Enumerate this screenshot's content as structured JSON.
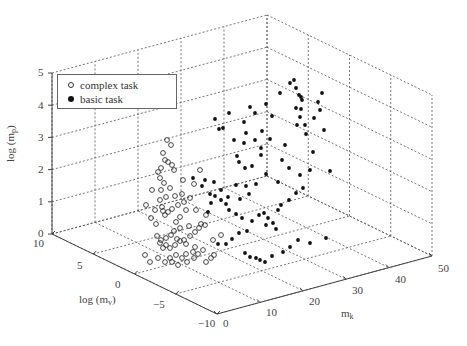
{
  "chart_data": {
    "type": "scatter",
    "subtype": "3d",
    "title": "",
    "axes": {
      "x": {
        "label": "m_k",
        "ticks": [
          "0",
          "10",
          "20",
          "30",
          "40",
          "50"
        ],
        "range": [
          0,
          50
        ]
      },
      "y": {
        "label": "log (m_v)",
        "ticks": [
          "10",
          "5",
          "0",
          "-5",
          "-10"
        ],
        "range": [
          -10,
          10
        ]
      },
      "z": {
        "label": "log (m_p)",
        "ticks": [
          "0",
          "1",
          "2",
          "3",
          "4",
          "5"
        ],
        "range": [
          0,
          5
        ]
      }
    },
    "grid": true,
    "legend": {
      "position": "upper-left",
      "entries": [
        {
          "label": "complex task",
          "marker": "open-circle"
        },
        {
          "label": "basic task",
          "marker": "filled-circle"
        }
      ]
    },
    "series": [
      {
        "name": "complex task",
        "marker": "open-circle",
        "description": "Clustered at low m_k (~0-10), log(m_v) roughly -5 to 10, log(m_p) ~0 to 2.5",
        "screen_points": [
          [
            163,
            153
          ],
          [
            165,
            160
          ],
          [
            168,
            162
          ],
          [
            172,
            165
          ],
          [
            174,
            170
          ],
          [
            160,
            178
          ],
          [
            164,
            183
          ],
          [
            161,
            190
          ],
          [
            170,
            188
          ],
          [
            166,
            197
          ],
          [
            175,
            196
          ],
          [
            182,
            194
          ],
          [
            160,
            200
          ],
          [
            162,
            207
          ],
          [
            163,
            211
          ],
          [
            165,
            215
          ],
          [
            168,
            212
          ],
          [
            172,
            209
          ],
          [
            178,
            205
          ],
          [
            184,
            202
          ],
          [
            190,
            198
          ],
          [
            186,
            210
          ],
          [
            176,
            222
          ],
          [
            180,
            228
          ],
          [
            174,
            231
          ],
          [
            171,
            235
          ],
          [
            166,
            238
          ],
          [
            161,
            240
          ],
          [
            157,
            236
          ],
          [
            160,
            243
          ],
          [
            163,
            248
          ],
          [
            166,
            245
          ],
          [
            170,
            248
          ],
          [
            175,
            245
          ],
          [
            180,
            241
          ],
          [
            184,
            240
          ],
          [
            190,
            236
          ],
          [
            195,
            232
          ],
          [
            199,
            228
          ],
          [
            205,
            225
          ],
          [
            193,
            252
          ],
          [
            186,
            254
          ],
          [
            182,
            258
          ],
          [
            176,
            255
          ],
          [
            170,
            258
          ],
          [
            165,
            262
          ],
          [
            172,
            262
          ],
          [
            178,
            265
          ],
          [
            187,
            262
          ],
          [
            194,
            258
          ],
          [
            198,
            254
          ],
          [
            203,
            250
          ],
          [
            156,
            224
          ],
          [
            151,
            218
          ],
          [
            146,
            205
          ],
          [
            158,
            172
          ],
          [
            161,
            168
          ],
          [
            167,
            140
          ],
          [
            171,
            145
          ],
          [
            180,
            217
          ],
          [
            186,
            244
          ],
          [
            213,
            240
          ],
          [
            221,
            235
          ],
          [
            196,
            210
          ],
          [
            206,
            215
          ],
          [
            152,
            190
          ],
          [
            155,
            210
          ],
          [
            183,
            180
          ],
          [
            194,
            184
          ],
          [
            200,
            170
          ],
          [
            145,
            255
          ],
          [
            150,
            262
          ],
          [
            158,
            258
          ],
          [
            177,
            239
          ],
          [
            195,
            247
          ],
          [
            206,
            262
          ],
          [
            211,
            258
          ],
          [
            214,
            255
          ],
          [
            201,
            224
          ],
          [
            189,
            226
          ]
        ]
      },
      {
        "name": "basic task",
        "marker": "filled-circle",
        "description": "Spread over m_k ~10-50, log(m_v) roughly -10 to 10, log(m_p) ~0.5 to 4.7",
        "screen_points": [
          [
            294,
            80
          ],
          [
            296,
            88
          ],
          [
            299,
            95
          ],
          [
            301,
            97
          ],
          [
            302,
            100
          ],
          [
            296,
            108
          ],
          [
            301,
            109
          ],
          [
            300,
            117
          ],
          [
            305,
            125
          ],
          [
            306,
            134
          ],
          [
            297,
            125
          ],
          [
            280,
            93
          ],
          [
            290,
            83
          ],
          [
            266,
            104
          ],
          [
            255,
            113
          ],
          [
            244,
            122
          ],
          [
            246,
            133
          ],
          [
            262,
            131
          ],
          [
            270,
            139
          ],
          [
            261,
            155
          ],
          [
            245,
            168
          ],
          [
            244,
            143
          ],
          [
            229,
            113
          ],
          [
            215,
            119
          ],
          [
            223,
            128
          ],
          [
            234,
            140
          ],
          [
            237,
            156
          ],
          [
            239,
            162
          ],
          [
            252,
            166
          ],
          [
            266,
            174
          ],
          [
            278,
            182
          ],
          [
            256,
            184
          ],
          [
            249,
            194
          ],
          [
            240,
            199
          ],
          [
            228,
            197
          ],
          [
            221,
            190
          ],
          [
            214,
            182
          ],
          [
            205,
            180
          ],
          [
            193,
            178
          ],
          [
            202,
            186
          ],
          [
            210,
            194
          ],
          [
            215,
            196
          ],
          [
            221,
            200
          ],
          [
            226,
            204
          ],
          [
            229,
            210
          ],
          [
            236,
            214
          ],
          [
            242,
            218
          ],
          [
            252,
            221
          ],
          [
            259,
            215
          ],
          [
            264,
            213
          ],
          [
            268,
            218
          ],
          [
            273,
            223
          ],
          [
            278,
            210
          ],
          [
            281,
            205
          ],
          [
            289,
            200
          ],
          [
            296,
            193
          ],
          [
            303,
            188
          ],
          [
            276,
            229
          ],
          [
            266,
            225
          ],
          [
            247,
            231
          ],
          [
            239,
            233
          ],
          [
            232,
            239
          ],
          [
            226,
            244
          ],
          [
            218,
            244
          ],
          [
            245,
            253
          ],
          [
            250,
            257
          ],
          [
            256,
            258
          ],
          [
            260,
            260
          ],
          [
            265,
            262
          ],
          [
            272,
            256
          ],
          [
            283,
            252
          ],
          [
            290,
            247
          ],
          [
            298,
            240
          ],
          [
            310,
            243
          ],
          [
            326,
            238
          ],
          [
            219,
            129
          ],
          [
            250,
            107
          ],
          [
            272,
            116
          ],
          [
            285,
            145
          ],
          [
            318,
            102
          ],
          [
            322,
            93
          ],
          [
            320,
            110
          ],
          [
            313,
            152
          ],
          [
            330,
            171
          ],
          [
            310,
            170
          ],
          [
            300,
            175
          ],
          [
            289,
            168
          ],
          [
            282,
            160
          ],
          [
            324,
            130
          ],
          [
            314,
            118
          ],
          [
            261,
            148
          ],
          [
            255,
            140
          ],
          [
            211,
            203
          ],
          [
            208,
            212
          ],
          [
            236,
            185
          ],
          [
            246,
            186
          ]
        ]
      }
    ]
  },
  "labels": {
    "z_axis": "log (m",
    "z_axis_sub": "p",
    "y_axis": "log (m",
    "y_axis_sub": "v",
    "x_axis": "m",
    "x_axis_sub": "k",
    "close_paren": ")"
  },
  "legend": {
    "complex": "complex task",
    "basic": "basic task"
  },
  "ticks": {
    "z": [
      "0",
      "1",
      "2",
      "3",
      "4",
      "5"
    ],
    "y": [
      "10",
      "5",
      "0",
      "−5",
      "−10"
    ],
    "x": [
      "0",
      "10",
      "20",
      "30",
      "40",
      "50"
    ]
  }
}
